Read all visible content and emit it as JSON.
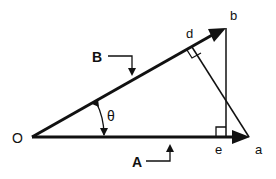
{
  "diagram": {
    "labels": {
      "origin": "O",
      "vector_a": "A",
      "vector_b": "B",
      "angle": "θ",
      "point_a": "a",
      "point_b": "b",
      "point_d": "d",
      "point_e": "e"
    },
    "colors": {
      "stroke": "#111111",
      "background": "#ffffff"
    }
  }
}
